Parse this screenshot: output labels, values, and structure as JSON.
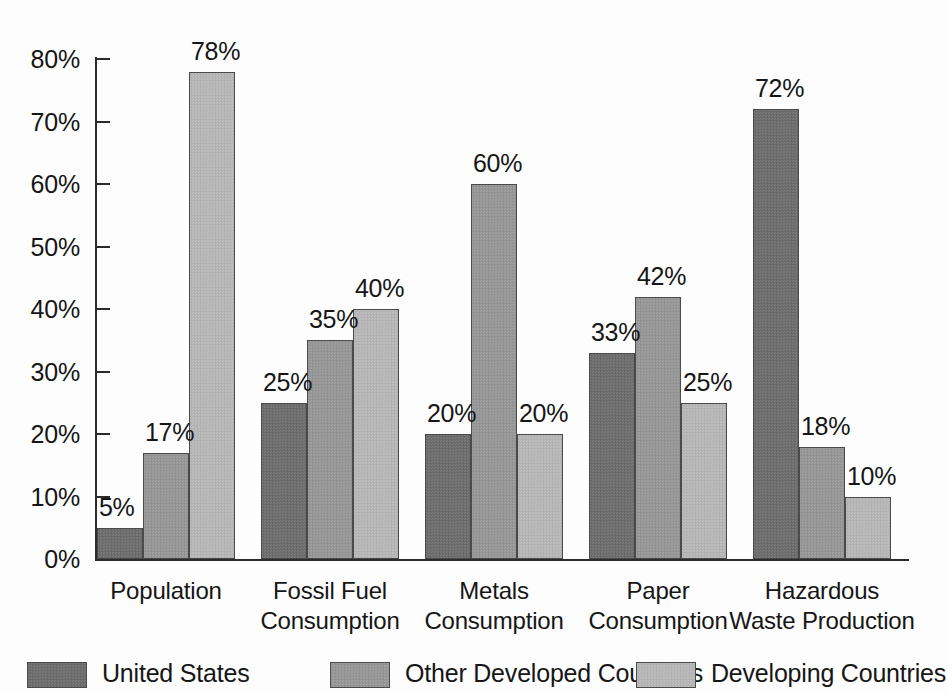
{
  "chart_data": {
    "type": "bar",
    "title": "",
    "subtitle": "",
    "xlabel": "",
    "ylabel": "",
    "ylim": [
      0,
      80
    ],
    "grid": false,
    "legend_position": "bottom",
    "tick_format": "percent",
    "y_ticks": [
      "0%",
      "10%",
      "20%",
      "30%",
      "40%",
      "50%",
      "60%",
      "70%",
      "80%"
    ],
    "y_tick_values": [
      0,
      10,
      20,
      30,
      40,
      50,
      60,
      70,
      80
    ],
    "categories": [
      "Population",
      "Fossil Fuel Consumption",
      "Metals Consumption",
      "Paper Consumption",
      "Hazardous Waste Production"
    ],
    "category_lines": [
      [
        "Population"
      ],
      [
        "Fossil Fuel",
        "Consumption"
      ],
      [
        "Metals",
        "Consumption"
      ],
      [
        "Paper",
        "Consumption"
      ],
      [
        "Hazardous",
        "Waste Production"
      ]
    ],
    "series": [
      {
        "name": "United States",
        "color": "#6e6e6e",
        "values": [
          5,
          25,
          20,
          33,
          72
        ],
        "labels": [
          "5%",
          "25%",
          "20%",
          "33%",
          "72%"
        ]
      },
      {
        "name": "Other Developed Countries",
        "color": "#979797",
        "values": [
          17,
          35,
          60,
          42,
          18
        ],
        "labels": [
          "17%",
          "35%",
          "60%",
          "42%",
          "18%"
        ]
      },
      {
        "name": "Developing Countries",
        "color": "#b6b6b6",
        "values": [
          78,
          40,
          20,
          25,
          10
        ],
        "labels": [
          "78%",
          "40%",
          "20%",
          "25%",
          "10%"
        ]
      }
    ]
  },
  "legend": {
    "entries": [
      {
        "label": "United States",
        "swatch_x": 27,
        "label_x": 102
      },
      {
        "label": "Other Developed Countries",
        "swatch_x": 330,
        "label_x": 405
      },
      {
        "label": "Developing Countries",
        "swatch_x": 636,
        "label_x": 711
      }
    ]
  },
  "axis": {
    "baseline_y": 559,
    "axis_x": 95,
    "top_y": 57,
    "px_per_10pct": 62.5
  },
  "layout": {
    "group_start_x": 97,
    "bar_width": 46,
    "group_gap": 26
  }
}
